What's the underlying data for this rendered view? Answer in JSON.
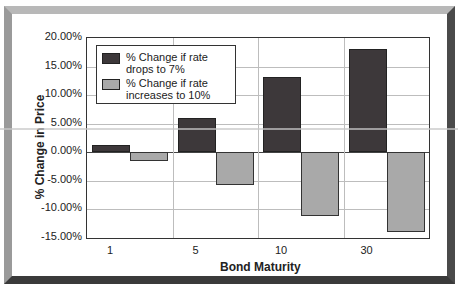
{
  "chart_data": {
    "type": "bar",
    "title": "",
    "xlabel": "Bond Maturity",
    "ylabel": "% Change in Price",
    "categories": [
      "1",
      "5",
      "10",
      "30"
    ],
    "series": [
      {
        "name": "% Change if rate drops to 7%",
        "values": [
          1.2,
          6.0,
          13.2,
          18.1
        ],
        "color": "#3d383a"
      },
      {
        "name": "% Change if rate increases to 10%",
        "values": [
          -1.6,
          -5.7,
          -11.1,
          -13.9
        ],
        "color": "#a9a9a9"
      }
    ],
    "ylim": [
      -15,
      20
    ],
    "yticks": [
      "20.00%",
      "15.00%",
      "10.00%",
      "5.00%",
      "0.00%",
      "-5.00%",
      "-10.00%",
      "-15.00%"
    ],
    "grid": true,
    "legend_position": "upper-left inside"
  },
  "legend": {
    "items": [
      {
        "label": "% Change if rate drops to 7%"
      },
      {
        "label": "% Change if rate increases to 10%"
      }
    ]
  },
  "axes": {
    "xlabel": "Bond Maturity",
    "ylabel": "% Change in Price",
    "yticks": [
      "20.00%",
      "15.00%",
      "10.00%",
      "5.00%",
      "0.00%",
      "-5.00%",
      "-10.00%",
      "-15.00%"
    ],
    "xticks": [
      "1",
      "5",
      "10",
      "30"
    ]
  }
}
